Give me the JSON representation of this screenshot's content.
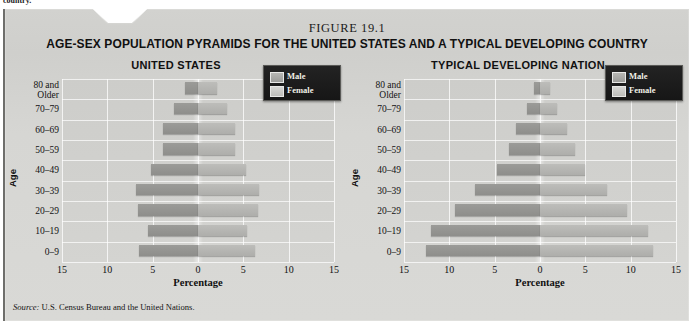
{
  "page_fragment": "country.",
  "figure": {
    "number": "FIGURE 19.1",
    "title": "AGE-SEX POPULATION PYRAMIDS FOR THE UNITED STATES AND A TYPICAL DEVELOPING COUNTRY",
    "source": "Source: U.S. Census Bureau and the United Nations."
  },
  "legend": {
    "male_label": "Male",
    "female_label": "Female",
    "male_color": "#9b9b98",
    "female_color": "#bdbdba",
    "background_color": "#161616"
  },
  "axes": {
    "y_title": "Age",
    "x_title": "Percentage",
    "x_ticks": [
      "15",
      "10",
      "5",
      "0",
      "5",
      "10",
      "15"
    ],
    "x_tick_values": [
      -15,
      -10,
      -5,
      0,
      5,
      10,
      15
    ],
    "x_min": -15,
    "x_max": 15,
    "age_groups": [
      "80 and Older",
      "70–79",
      "60–69",
      "50–59",
      "40–49",
      "30–39",
      "20–29",
      "10–19",
      "0–9"
    ]
  },
  "chart_data": [
    {
      "type": "bar",
      "subtype": "population-pyramid",
      "title": "UNITED STATES",
      "xlabel": "Percentage",
      "ylabel": "Age",
      "xlim": [
        -15,
        15
      ],
      "grid": true,
      "legend_position": "top-right",
      "categories": [
        "80 and Older",
        "70–79",
        "60–69",
        "50–59",
        "40–49",
        "30–39",
        "20–29",
        "10–19",
        "0–9"
      ],
      "series": [
        {
          "name": "Male",
          "values": [
            1.4,
            2.6,
            3.9,
            3.9,
            5.2,
            6.8,
            6.6,
            5.5,
            6.5
          ]
        },
        {
          "name": "Female",
          "values": [
            2.1,
            3.2,
            4.1,
            4.1,
            5.3,
            6.7,
            6.6,
            5.4,
            6.3
          ]
        }
      ]
    },
    {
      "type": "bar",
      "subtype": "population-pyramid",
      "title": "TYPICAL DEVELOPING NATION",
      "xlabel": "Percentage",
      "ylabel": "Age",
      "xlim": [
        -15,
        15
      ],
      "grid": true,
      "legend_position": "top-right",
      "categories": [
        "80 and Older",
        "70–79",
        "60–69",
        "50–59",
        "40–49",
        "30–39",
        "20–29",
        "10–19",
        "0–9"
      ],
      "series": [
        {
          "name": "Male",
          "values": [
            0.7,
            1.4,
            2.6,
            3.4,
            4.7,
            7.2,
            9.4,
            12.0,
            12.6
          ]
        },
        {
          "name": "Female",
          "values": [
            1.1,
            1.9,
            3.0,
            3.9,
            5.0,
            7.4,
            9.6,
            11.9,
            12.5
          ]
        }
      ]
    }
  ],
  "panels": [
    {
      "title": "UNITED STATES"
    },
    {
      "title": "TYPICAL DEVELOPING NATION"
    }
  ]
}
